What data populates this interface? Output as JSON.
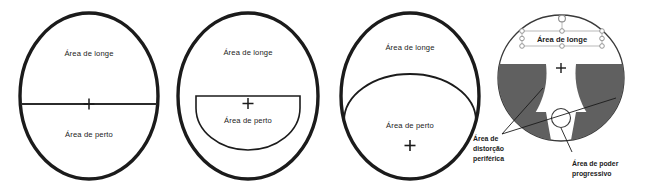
{
  "page": {
    "background": "#ffffff",
    "ink": "#1b1b1b",
    "distortion_fill": "#606060",
    "handle_stroke": "#8a8a8a"
  },
  "figures": [
    {
      "id": "single-vision-flat-top-bifocal",
      "name": "lens-diagram-1",
      "far_label": "Área de longe",
      "near_label": "Área de perto",
      "center_marker": "+",
      "segment_style": "straight-line-bifocal"
    },
    {
      "id": "d-segment-bifocal",
      "name": "lens-diagram-2",
      "far_label": "Área de longe",
      "near_label": "Área de perto",
      "center_marker": "+",
      "segment_style": "d-shaped-segment"
    },
    {
      "id": "large-round-segment-bifocal",
      "name": "lens-diagram-3",
      "far_label": "Área de longe",
      "near_label": "Área de perto",
      "center_marker": "+",
      "segment_style": "large-curved-segment"
    },
    {
      "id": "progressive-lens",
      "name": "lens-diagram-4",
      "far_label": "Área de longe",
      "center_marker": "+",
      "callouts": [
        {
          "name": "peripheral-distortion",
          "lines": [
            "Área de",
            "distorção",
            "periférica"
          ]
        },
        {
          "name": "progressive-power",
          "lines": [
            "Área de poder",
            "progressivo"
          ]
        }
      ],
      "selection": {
        "selected": true,
        "handle_count": 8,
        "rotation_handle": true,
        "selected_text": "Área de longe"
      }
    }
  ]
}
